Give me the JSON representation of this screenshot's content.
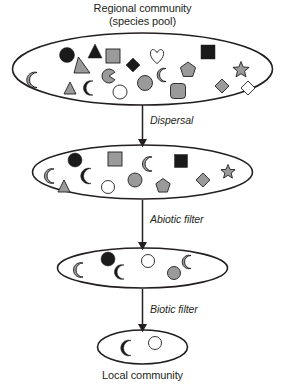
{
  "diagram": {
    "title_line1": "Regional community",
    "title_line2": "(species pool)",
    "caption": "Local community",
    "arrow_labels": {
      "dispersal": "Dispersal",
      "abiotic": "Abiotic filter",
      "biotic": "Biotic filter"
    },
    "colors": {
      "stroke": "#231f20",
      "black_fill": "#1a1a1a",
      "gray_fill": "#9a9a9a",
      "light_gray_fill": "#b3b3b3",
      "white_fill": "#ffffff",
      "background": "#ffffff"
    },
    "ellipses": [
      {
        "name": "regional-community-pool",
        "cx": 142.5,
        "cy": 69,
        "rx": 130,
        "ry": 36,
        "shape_count": 22
      },
      {
        "name": "post-dispersal-pool",
        "cx": 142.5,
        "cy": 172,
        "rx": 110,
        "ry": 27,
        "shape_count": 14
      },
      {
        "name": "post-abiotic-filter-pool",
        "cx": 142.5,
        "cy": 268,
        "rx": 85,
        "ry": 20,
        "shape_count": 6
      },
      {
        "name": "local-community-pool",
        "cx": 142.5,
        "cy": 347,
        "rx": 45,
        "ry": 17,
        "shape_count": 2
      }
    ],
    "arrows": [
      {
        "name": "dispersal-arrow",
        "x": 142.5,
        "y1": 105,
        "y2": 143
      },
      {
        "name": "abiotic-filter-arrow",
        "x": 142.5,
        "y1": 200,
        "y2": 246
      },
      {
        "name": "biotic-filter-arrow",
        "x": 142.5,
        "y1": 289,
        "y2": 328
      }
    ],
    "shapes": {
      "regional": [
        {
          "kind": "crescent",
          "fill": "gray",
          "x": 37,
          "y": 80,
          "size": 15
        },
        {
          "kind": "circle",
          "fill": "black",
          "x": 67,
          "y": 55,
          "size": 15
        },
        {
          "kind": "triangle",
          "fill": "black",
          "x": 95,
          "y": 51,
          "size": 14
        },
        {
          "kind": "trapezoid",
          "fill": "gray",
          "x": 82,
          "y": 65,
          "size": 16
        },
        {
          "kind": "square",
          "fill": "gray",
          "x": 113,
          "y": 56,
          "size": 14
        },
        {
          "kind": "triangle",
          "fill": "gray",
          "x": 70,
          "y": 88,
          "size": 12
        },
        {
          "kind": "crescent",
          "fill": "black",
          "x": 93,
          "y": 88,
          "size": 14
        },
        {
          "kind": "pacman",
          "fill": "gray",
          "x": 109,
          "y": 76,
          "size": 14
        },
        {
          "kind": "diamond",
          "fill": "black",
          "x": 133,
          "y": 65,
          "size": 14
        },
        {
          "kind": "circle",
          "fill": "white",
          "x": 120,
          "y": 92,
          "size": 14
        },
        {
          "kind": "circle",
          "fill": "gray",
          "x": 145,
          "y": 83,
          "size": 15
        },
        {
          "kind": "heart",
          "fill": "white",
          "x": 157,
          "y": 56,
          "size": 16
        },
        {
          "kind": "crescent",
          "fill": "gray",
          "x": 166,
          "y": 75,
          "size": 13
        },
        {
          "kind": "roundsq",
          "fill": "gray",
          "x": 178,
          "y": 91,
          "size": 15
        },
        {
          "kind": "pentagon",
          "fill": "gray",
          "x": 188,
          "y": 70,
          "size": 16
        },
        {
          "kind": "square",
          "fill": "black",
          "x": 208,
          "y": 52,
          "size": 14
        },
        {
          "kind": "diamond",
          "fill": "gray",
          "x": 222,
          "y": 86,
          "size": 14
        },
        {
          "kind": "star",
          "fill": "gray",
          "x": 241,
          "y": 70,
          "size": 17
        },
        {
          "kind": "diamond",
          "fill": "white",
          "x": 248,
          "y": 88,
          "size": 14
        }
      ],
      "post_dispersal": [
        {
          "kind": "crescent",
          "fill": "gray",
          "x": 54,
          "y": 176,
          "size": 14
        },
        {
          "kind": "circle",
          "fill": "black",
          "x": 75,
          "y": 160,
          "size": 14
        },
        {
          "kind": "triangle",
          "fill": "gray",
          "x": 64,
          "y": 186,
          "size": 12
        },
        {
          "kind": "crescent",
          "fill": "black",
          "x": 91,
          "y": 176,
          "size": 15
        },
        {
          "kind": "square",
          "fill": "gray",
          "x": 115,
          "y": 159,
          "size": 14
        },
        {
          "kind": "circle",
          "fill": "white",
          "x": 108,
          "y": 187,
          "size": 13
        },
        {
          "kind": "circle",
          "fill": "gray",
          "x": 135,
          "y": 180,
          "size": 14
        },
        {
          "kind": "crescent",
          "fill": "gray",
          "x": 152,
          "y": 164,
          "size": 14
        },
        {
          "kind": "pentagon",
          "fill": "gray",
          "x": 163,
          "y": 186,
          "size": 15
        },
        {
          "kind": "square",
          "fill": "black",
          "x": 181,
          "y": 161,
          "size": 13
        },
        {
          "kind": "diamond",
          "fill": "gray",
          "x": 203,
          "y": 180,
          "size": 14
        },
        {
          "kind": "star",
          "fill": "gray",
          "x": 228,
          "y": 172,
          "size": 15
        }
      ],
      "post_abiotic": [
        {
          "kind": "crescent",
          "fill": "gray",
          "x": 83,
          "y": 270,
          "size": 14
        },
        {
          "kind": "circle",
          "fill": "black",
          "x": 108,
          "y": 259,
          "size": 14
        },
        {
          "kind": "crescent",
          "fill": "black",
          "x": 124,
          "y": 272,
          "size": 14
        },
        {
          "kind": "circle",
          "fill": "white",
          "x": 148,
          "y": 261,
          "size": 13
        },
        {
          "kind": "circle",
          "fill": "gray",
          "x": 174,
          "y": 273,
          "size": 13
        },
        {
          "kind": "crescent",
          "fill": "gray",
          "x": 191,
          "y": 262,
          "size": 13
        }
      ],
      "local": [
        {
          "kind": "crescent",
          "fill": "black",
          "x": 131,
          "y": 348,
          "size": 15
        },
        {
          "kind": "circle",
          "fill": "white",
          "x": 155,
          "y": 343,
          "size": 13
        }
      ]
    }
  }
}
